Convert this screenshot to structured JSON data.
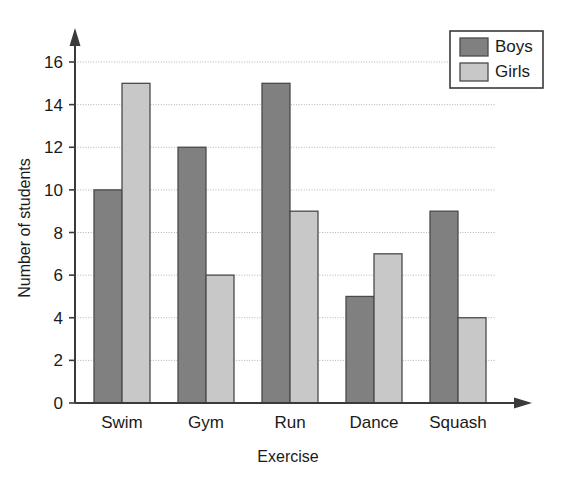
{
  "chart_data": {
    "type": "bar",
    "title": "",
    "subtitle": "",
    "xlabel": "Exercise",
    "ylabel": "Number of students",
    "categories": [
      "Swim",
      "Gym",
      "Run",
      "Dance",
      "Squash"
    ],
    "series": [
      {
        "name": "Boys",
        "color": "#808080",
        "values": [
          10,
          12,
          15,
          5,
          9
        ]
      },
      {
        "name": "Girls",
        "color": "#c8c8c8",
        "values": [
          15,
          6,
          9,
          7,
          4
        ]
      }
    ],
    "ylim": [
      0,
      16
    ],
    "ytick_step": 2,
    "yticks": [
      "0",
      "2",
      "4",
      "6",
      "8",
      "10",
      "12",
      "14",
      "16"
    ],
    "grid": true,
    "grid_axis": "y",
    "legend_position": "top-right",
    "legend_entries": [
      "Boys",
      "Girls"
    ],
    "axis_arrows": true,
    "background_color": "#ffffff",
    "axis_color": "#3a3a3a",
    "gridline_color": "#a8a8b4"
  }
}
